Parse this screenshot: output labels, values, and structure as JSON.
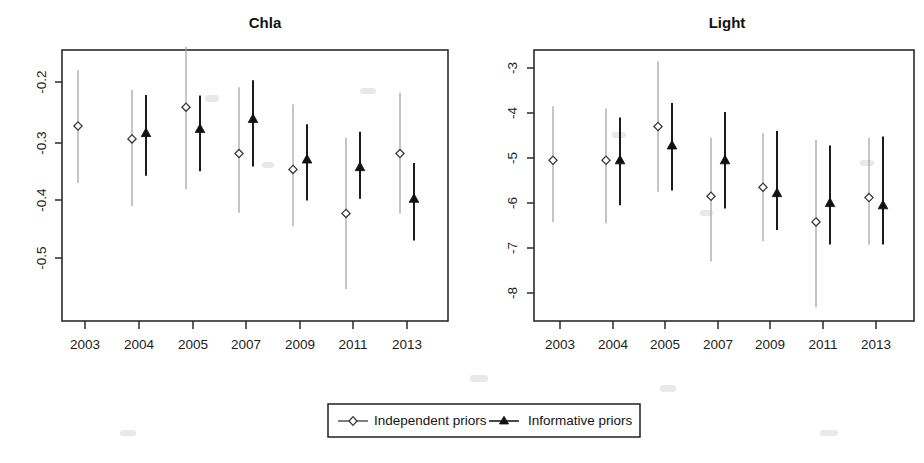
{
  "figure": {
    "background": "#ffffff",
    "width": 924,
    "height": 463
  },
  "legend": {
    "position": "bottom-center",
    "entries": [
      {
        "label": "Independent priors",
        "marker": "open-diamond",
        "color": "#9a9a9a"
      },
      {
        "label": "Informative priors",
        "marker": "filled-triangle",
        "color": "#1b1b1b"
      }
    ]
  },
  "chart_data": [
    {
      "type": "scatter",
      "title": "Chla",
      "xlabel": "",
      "ylabel": "",
      "grid": false,
      "categories": [
        "2003",
        "2004",
        "2005",
        "2007",
        "2009",
        "2011",
        "2013"
      ],
      "x_tick_labels": [
        "2003",
        "2004",
        "2005",
        "2007",
        "2009",
        "2011",
        "2013"
      ],
      "y_tick_labels": [
        "-0.2",
        "-0.3",
        "-0.4",
        "-0.5"
      ],
      "y_ticks": [
        -0.2,
        -0.3,
        -0.4,
        -0.5
      ],
      "ylim": [
        -0.57,
        -0.145
      ],
      "series": [
        {
          "name": "Independent priors",
          "marker": "open-diamond",
          "color": "#9a9a9a",
          "values": [
            -0.275,
            -0.297,
            -0.243,
            -0.322,
            -0.349,
            -0.424,
            -0.322
          ],
          "lower": [
            -0.372,
            -0.412,
            -0.383,
            -0.423,
            -0.446,
            -0.553,
            -0.424
          ],
          "upper": [
            -0.18,
            -0.213,
            -0.14,
            -0.209,
            -0.238,
            -0.295,
            -0.218
          ]
        },
        {
          "name": "Informative priors",
          "marker": "filled-triangle",
          "color": "#1b1b1b",
          "values": [
            null,
            -0.287,
            -0.28,
            -0.263,
            -0.332,
            -0.345,
            -0.399
          ],
          "lower": [
            null,
            -0.36,
            -0.352,
            -0.344,
            -0.402,
            -0.399,
            -0.47
          ],
          "upper": [
            null,
            -0.222,
            -0.223,
            -0.197,
            -0.272,
            -0.285,
            -0.338
          ]
        }
      ]
    },
    {
      "type": "scatter",
      "title": "Light",
      "xlabel": "",
      "ylabel": "",
      "grid": false,
      "categories": [
        "2003",
        "2004",
        "2005",
        "2007",
        "2009",
        "2011",
        "2013"
      ],
      "x_tick_labels": [
        "2003",
        "2004",
        "2005",
        "2007",
        "2009",
        "2011",
        "2013"
      ],
      "y_tick_labels": [
        "-3",
        "-4",
        "-5",
        "-6",
        "-7",
        "-8"
      ],
      "y_ticks": [
        -3,
        -4,
        -5,
        -6,
        -7,
        -8
      ],
      "ylim": [
        -8.55,
        -2.48
      ],
      "series": [
        {
          "name": "Independent priors",
          "marker": "open-diamond",
          "color": "#9a9a9a",
          "values": [
            -5.05,
            -5.05,
            -4.3,
            -5.85,
            -5.65,
            -6.42,
            -5.88
          ],
          "lower": [
            -6.42,
            -6.45,
            -5.75,
            -7.3,
            -6.85,
            -8.32,
            -6.93
          ],
          "upper": [
            -3.85,
            -3.9,
            -2.85,
            -4.55,
            -4.45,
            -4.6,
            -4.55
          ]
        },
        {
          "name": "Informative priors",
          "marker": "filled-triangle",
          "color": "#1b1b1b",
          "values": [
            null,
            -5.05,
            -4.72,
            -5.05,
            -5.78,
            -6.0,
            -6.05
          ],
          "lower": [
            null,
            -6.05,
            -5.72,
            -6.12,
            -6.6,
            -6.92,
            -6.92
          ],
          "upper": [
            null,
            -4.1,
            -3.78,
            -3.98,
            -4.4,
            -4.72,
            -4.52
          ]
        }
      ]
    }
  ]
}
